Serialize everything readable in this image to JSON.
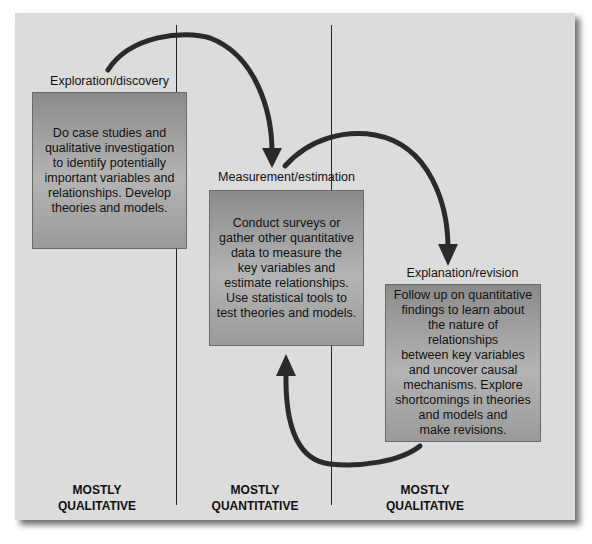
{
  "diagram": {
    "stages": [
      {
        "label": "Exploration/discovery",
        "text": "Do case studies and\nqualitative investigation\nto identify potentially\nimportant variables and\nrelationships. Develop\ntheories and models."
      },
      {
        "label": "Measurement/estimation",
        "text": "Conduct surveys or\ngather other quantitative\ndata to measure the\nkey variables and\nestimate relationships.\nUse statistical tools to\ntest theories and models."
      },
      {
        "label": "Explanation/revision",
        "text": "Follow up on quantitative\nfindings to learn about\nthe nature of relationships\nbetween key variables\nand uncover causal\nmechanisms. Explore\nshortcomings in theories\nand models and\nmake revisions."
      }
    ],
    "columns": [
      {
        "label": "MOSTLY\nQUALITATIVE"
      },
      {
        "label": "MOSTLY\nQUANTITATIVE"
      },
      {
        "label": "MOSTLY\nQUALITATIVE"
      }
    ],
    "arrows": [
      {
        "from": "Exploration/discovery",
        "to": "Measurement/estimation"
      },
      {
        "from": "Measurement/estimation",
        "to": "Explanation/revision"
      },
      {
        "from": "Explanation/revision",
        "to": "Measurement/estimation"
      }
    ],
    "colors": {
      "panel": "#dcdcdc",
      "box": "#a0a0a0",
      "arrow": "#2a2a2a",
      "text": "#111111"
    }
  }
}
